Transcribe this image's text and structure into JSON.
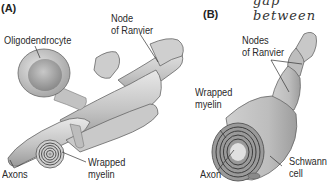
{
  "top_fragment": "gap between",
  "panel_a": {
    "letter": "(A)",
    "labels": {
      "oligodendrocyte": "Oligodendrocyte",
      "node_line1": "Node",
      "node_line2": "of Ranvier",
      "axons": "Axons",
      "wrapped_line1": "Wrapped",
      "wrapped_line2": "myelin"
    }
  },
  "panel_b": {
    "letter": "(B)",
    "labels": {
      "nodes_line1": "Nodes",
      "nodes_line2": "of Ranvier",
      "wrapped_line1": "Wrapped",
      "wrapped_line2": "myelin",
      "axon": "Axon",
      "schwann_line1": "Schwann",
      "schwann_line2": "cell"
    }
  },
  "colors": {
    "tissue_light": "#d9d9d9",
    "tissue_mid": "#b5b5b5",
    "tissue_dark": "#7d7d7d",
    "outline": "#555555",
    "text": "#2a2a2a"
  }
}
